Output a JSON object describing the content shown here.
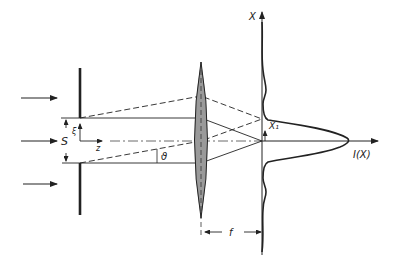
{
  "diagram": {
    "labels": {
      "slit_width": "S",
      "transverse_coord": "ξ",
      "optical_axis": "z",
      "diffraction_angle": "ϑ",
      "screen_axis": "X",
      "first_min": "X₁",
      "intensity": "I(X)",
      "focal_length": "f"
    },
    "colors": {
      "ink": "#222222",
      "lens_fill": "#9a9a9a",
      "background": "#ffffff"
    },
    "incident_arrows": 3
  }
}
